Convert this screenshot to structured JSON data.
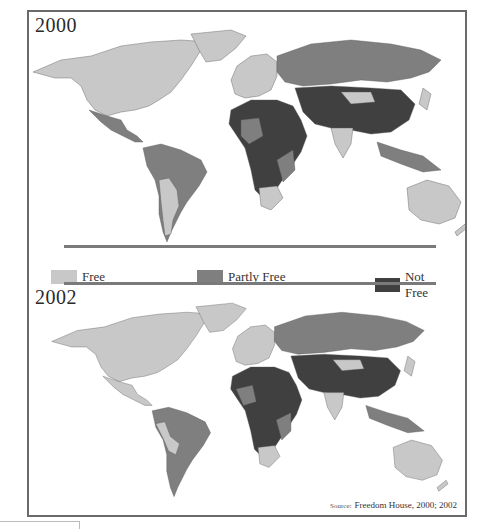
{
  "panels": [
    {
      "year": "2000"
    },
    {
      "year": "2002"
    }
  ],
  "legend": {
    "items": [
      {
        "label": "Free",
        "color": "#c8c8c8"
      },
      {
        "label": "Partly Free",
        "color": "#7f7f7f"
      },
      {
        "label": "Not Free",
        "color": "#404040"
      }
    ]
  },
  "source": {
    "prefix": "Source:",
    "text": "Freedom House, 2000; 2002"
  },
  "colors": {
    "free": "#c8c8c8",
    "partly_free": "#7f7f7f",
    "not_free": "#404040",
    "frame": "#6a6a6a",
    "separator": "#7a7a7a"
  }
}
